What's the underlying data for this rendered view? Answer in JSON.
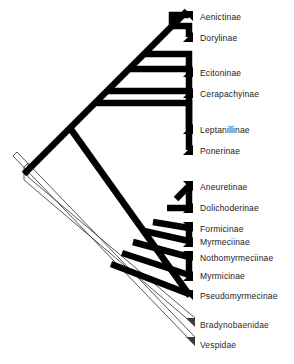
{
  "figure": {
    "type": "phylogenetic-cladogram",
    "orientation": "diagonal",
    "background_color": "#ffffff",
    "ingroup_line_color": "#000000",
    "outgroup_line_color": "#4a4a4a",
    "text_color": "#1a1a1a"
  },
  "taxa": [
    {
      "id": "aenictinae",
      "label": "Aenictinae",
      "group": "ingroup",
      "label_x": 200,
      "label_y": 13,
      "tip_x": 190,
      "tip_y": 17
    },
    {
      "id": "dorylinae",
      "label": "Dorylinae",
      "group": "ingroup",
      "label_x": 200,
      "label_y": 34,
      "tip_x": 190,
      "tip_y": 38
    },
    {
      "id": "ecitoninae",
      "label": "Ecitoninae",
      "group": "ingroup",
      "label_x": 200,
      "label_y": 69,
      "tip_x": 190,
      "tip_y": 73
    },
    {
      "id": "cerapachyinae",
      "label": "Cerapachyinae",
      "group": "ingroup",
      "label_x": 200,
      "label_y": 90,
      "tip_x": 190,
      "tip_y": 94
    },
    {
      "id": "leptanillinae",
      "label": "Leptanillinae",
      "group": "ingroup",
      "label_x": 200,
      "label_y": 126,
      "tip_x": 190,
      "tip_y": 130
    },
    {
      "id": "ponerinae",
      "label": "Ponerinae",
      "group": "ingroup",
      "label_x": 200,
      "label_y": 147,
      "tip_x": 190,
      "tip_y": 151
    },
    {
      "id": "aneuretinae",
      "label": "Aneuretinae",
      "group": "ingroup",
      "label_x": 200,
      "label_y": 183,
      "tip_x": 190,
      "tip_y": 187
    },
    {
      "id": "dolichoderinae",
      "label": "Dolichoderinae",
      "group": "ingroup",
      "label_x": 200,
      "label_y": 204,
      "tip_x": 190,
      "tip_y": 208
    },
    {
      "id": "formicinae",
      "label": "Formicinae",
      "group": "ingroup",
      "label_x": 200,
      "label_y": 225,
      "tip_x": 190,
      "tip_y": 229
    },
    {
      "id": "myrmeciinae",
      "label": "Myrmeciinae",
      "group": "ingroup",
      "label_x": 200,
      "label_y": 238,
      "tip_x": 190,
      "tip_y": 242
    },
    {
      "id": "nothomyrmeciinae",
      "label": "Nothomyrmeciinae",
      "group": "ingroup",
      "label_x": 200,
      "label_y": 254,
      "tip_x": 190,
      "tip_y": 258
    },
    {
      "id": "myrmicinae",
      "label": "Myrmicinae",
      "group": "ingroup",
      "label_x": 200,
      "label_y": 272,
      "tip_x": 190,
      "tip_y": 276
    },
    {
      "id": "pseudomyrmecinae",
      "label": "Pseudomyrmecinae",
      "group": "ingroup",
      "label_x": 200,
      "label_y": 292,
      "tip_x": 190,
      "tip_y": 296
    },
    {
      "id": "bradynobaenidae",
      "label": "Bradynobaenidae",
      "group": "outgroup",
      "label_x": 200,
      "label_y": 325,
      "tip_x": 190,
      "tip_y": 324
    },
    {
      "id": "vespidae",
      "label": "Vespidae",
      "group": "outgroup",
      "label_x": 200,
      "label_y": 345,
      "tip_x": 190,
      "tip_y": 344
    }
  ],
  "geometry": {
    "spine": {
      "x1": 186,
      "y1": 12,
      "x2": 22,
      "y2": 176
    },
    "ingroup_stroke_width": 6.5,
    "outgroup_stroke_width": 1.1,
    "root_x": 22,
    "root_y": 176,
    "nodes": [
      {
        "id": "n-dorylomorph-crown",
        "x": 171,
        "y": 27
      },
      {
        "id": "n-ecitoninae-join",
        "x": 144,
        "y": 54
      },
      {
        "id": "n-cerapachyinae-join",
        "x": 130,
        "y": 68
      },
      {
        "id": "n-poneroid-a",
        "x": 107,
        "y": 91
      },
      {
        "id": "n-leptanillinae",
        "x": 95,
        "y": 103
      },
      {
        "id": "n-formicoid-base",
        "x": 72,
        "y": 126
      },
      {
        "id": "n-aneuretinae",
        "x": 175,
        "y": 198
      },
      {
        "id": "n-dolichoderinae",
        "x": 166,
        "y": 207
      },
      {
        "id": "n-formicinae",
        "x": 152,
        "y": 221
      },
      {
        "id": "n-myrmeciinae",
        "x": 143,
        "y": 230
      },
      {
        "id": "n-nothomyrmeciinae",
        "x": 132,
        "y": 241
      },
      {
        "id": "n-myrmicinae",
        "x": 121,
        "y": 252
      },
      {
        "id": "n-pseudomyrmecinae",
        "x": 110,
        "y": 263
      }
    ]
  }
}
